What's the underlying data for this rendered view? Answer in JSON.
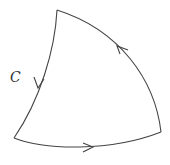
{
  "diagram": {
    "curve_label": "C",
    "stroke_color": "#444444",
    "background": "#ffffff",
    "vertices": {
      "top": [
        57,
        10
      ],
      "bottom_left": [
        14,
        138
      ],
      "bottom_right": [
        161,
        132
      ]
    },
    "edges": [
      {
        "name": "left-arc",
        "from": "top",
        "to": "bottom_left",
        "direction": "downward"
      },
      {
        "name": "bottom-arc",
        "from": "bottom_left",
        "to": "bottom_right",
        "direction": "rightward"
      },
      {
        "name": "right-arc",
        "from": "bottom_right",
        "to": "top",
        "direction": "upward"
      }
    ]
  }
}
